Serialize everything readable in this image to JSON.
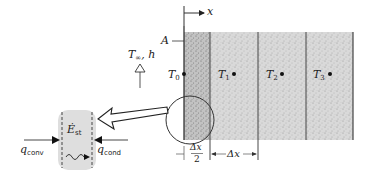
{
  "figure": {
    "type": "finite-difference surface node energy balance",
    "colors": {
      "line": "#333333",
      "slab_fill": "#d6d6d6",
      "first_half_cell_fill": "#bdbdbd",
      "element_fill": "#e0e0e0",
      "background": "#ffffff"
    }
  },
  "axis": {
    "label": "x"
  },
  "surface": {
    "area_label": "A"
  },
  "convection": {
    "T_symbol": "T",
    "T_sub": "∞",
    "h_label": ", h"
  },
  "nodes": [
    {
      "symbol": "T",
      "sub": "0"
    },
    {
      "symbol": "T",
      "sub": "1"
    },
    {
      "symbol": "T",
      "sub": "2"
    },
    {
      "symbol": "T",
      "sub": "3"
    }
  ],
  "spacing": {
    "half_num": "Δx",
    "half_den": "2",
    "full": "Δx"
  },
  "element": {
    "storage_symbol": "Ė",
    "storage_sub": "st",
    "q_conv_symbol": "q",
    "q_conv_sub": "conv",
    "q_cond_symbol": "q",
    "q_cond_sub": "cond"
  }
}
